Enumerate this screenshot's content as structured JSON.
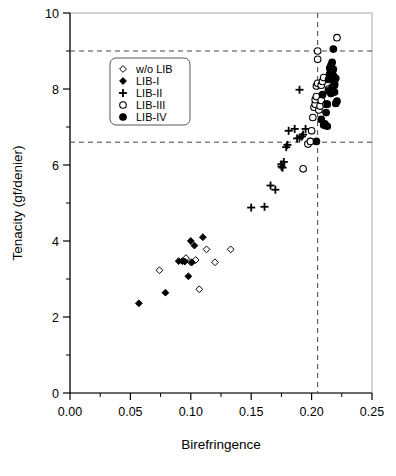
{
  "chart_data": {
    "type": "scatter",
    "title": "",
    "xlabel": "Birefringence",
    "ylabel": "Tenacity (gf/denier)",
    "xlim": [
      0.0,
      0.25
    ],
    "ylim": [
      0,
      10
    ],
    "xticks": [
      "0.00",
      "0.05",
      "0.10",
      "0.15",
      "0.20",
      "0.25"
    ],
    "xtick_values": [
      0.0,
      0.05,
      0.1,
      0.15,
      0.2,
      0.25
    ],
    "xminor_step": 0.025,
    "yticks": [
      "0",
      "2",
      "4",
      "6",
      "8",
      "10"
    ],
    "ytick_values": [
      0,
      2,
      4,
      6,
      8,
      10
    ],
    "yminor_step": 1,
    "grid": false,
    "legend_position": "upper-left",
    "reference_lines": [
      {
        "name": "upper-tenacity-limit",
        "orientation": "horizontal",
        "value": 9.0,
        "style": "dashed"
      },
      {
        "name": "lower-tenacity-limit",
        "orientation": "horizontal",
        "value": 6.6,
        "style": "dashed"
      },
      {
        "name": "birefringence-limit",
        "orientation": "vertical",
        "value": 0.205,
        "style": "dashed"
      }
    ],
    "series": [
      {
        "name": "w/o LIB",
        "marker": "open-diamond",
        "color": "#000000",
        "fill": "none",
        "points": [
          [
            0.074,
            3.23
          ],
          [
            0.096,
            3.55
          ],
          [
            0.1,
            3.44
          ],
          [
            0.104,
            3.5
          ],
          [
            0.107,
            2.73
          ],
          [
            0.113,
            3.78
          ],
          [
            0.12,
            3.44
          ],
          [
            0.133,
            3.78
          ]
        ]
      },
      {
        "name": "LIB-I",
        "marker": "filled-diamond",
        "color": "#000000",
        "fill": "solid",
        "points": [
          [
            0.057,
            2.36
          ],
          [
            0.079,
            2.64
          ],
          [
            0.09,
            3.47
          ],
          [
            0.093,
            3.47
          ],
          [
            0.095,
            3.46
          ],
          [
            0.098,
            3.07
          ],
          [
            0.1,
            4.0
          ],
          [
            0.103,
            3.88
          ],
          [
            0.101,
            3.44
          ],
          [
            0.11,
            4.1
          ]
        ]
      },
      {
        "name": "LIB-II",
        "marker": "plus",
        "color": "#000000",
        "fill": "solid",
        "points": [
          [
            0.15,
            4.88
          ],
          [
            0.161,
            4.9
          ],
          [
            0.166,
            5.46
          ],
          [
            0.17,
            5.35
          ],
          [
            0.175,
            5.96
          ],
          [
            0.175,
            6.02
          ],
          [
            0.177,
            6.08
          ],
          [
            0.176,
            5.93
          ],
          [
            0.179,
            6.47
          ],
          [
            0.18,
            6.53
          ],
          [
            0.181,
            6.9
          ],
          [
            0.186,
            6.95
          ],
          [
            0.188,
            6.7
          ],
          [
            0.19,
            6.72
          ],
          [
            0.19,
            7.98
          ],
          [
            0.192,
            6.75
          ],
          [
            0.193,
            6.8
          ],
          [
            0.195,
            6.95
          ]
        ]
      },
      {
        "name": "LIB-III",
        "marker": "open-circle",
        "color": "#000000",
        "fill": "none",
        "points": [
          [
            0.193,
            5.9
          ],
          [
            0.197,
            6.55
          ],
          [
            0.199,
            6.62
          ],
          [
            0.2,
            6.9
          ],
          [
            0.201,
            7.25
          ],
          [
            0.202,
            7.52
          ],
          [
            0.203,
            7.6
          ],
          [
            0.203,
            7.72
          ],
          [
            0.204,
            7.8
          ],
          [
            0.204,
            8.08
          ],
          [
            0.205,
            8.15
          ],
          [
            0.205,
            8.78
          ],
          [
            0.205,
            9.0
          ],
          [
            0.206,
            7.45
          ],
          [
            0.207,
            7.55
          ],
          [
            0.208,
            7.7
          ],
          [
            0.208,
            8.1
          ],
          [
            0.209,
            8.2
          ],
          [
            0.21,
            8.3
          ],
          [
            0.212,
            7.6
          ],
          [
            0.214,
            8.0
          ],
          [
            0.221,
            9.35
          ]
        ]
      },
      {
        "name": "LIB-IV",
        "marker": "filled-circle",
        "color": "#000000",
        "fill": "solid",
        "points": [
          [
            0.204,
            6.62
          ],
          [
            0.208,
            7.2
          ],
          [
            0.209,
            7.85
          ],
          [
            0.21,
            7.05
          ],
          [
            0.211,
            7.08
          ],
          [
            0.212,
            7.38
          ],
          [
            0.213,
            7.6
          ],
          [
            0.214,
            7.95
          ],
          [
            0.214,
            8.25
          ],
          [
            0.215,
            8.4
          ],
          [
            0.215,
            8.55
          ],
          [
            0.216,
            8.3
          ],
          [
            0.216,
            8.62
          ],
          [
            0.217,
            8.45
          ],
          [
            0.217,
            8.7
          ],
          [
            0.217,
            8.05
          ],
          [
            0.218,
            8.35
          ],
          [
            0.218,
            8.52
          ],
          [
            0.218,
            9.05
          ],
          [
            0.219,
            8.15
          ],
          [
            0.219,
            7.92
          ],
          [
            0.22,
            8.28
          ],
          [
            0.22,
            7.62
          ],
          [
            0.221,
            7.68
          ],
          [
            0.216,
            7.88
          ],
          [
            0.213,
            7.02
          ],
          [
            0.219,
            8.1
          ]
        ]
      }
    ]
  },
  "legend": {
    "entries": [
      {
        "label": "w/o LIB",
        "marker": "open-diamond"
      },
      {
        "label": "LIB-I",
        "marker": "filled-diamond"
      },
      {
        "label": "LIB-II",
        "marker": "plus"
      },
      {
        "label": "LIB-III",
        "marker": "open-circle"
      },
      {
        "label": "LIB-IV",
        "marker": "filled-circle"
      }
    ]
  }
}
